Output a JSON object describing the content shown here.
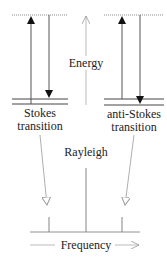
{
  "diagram": {
    "energy_label": "Energy",
    "stokes": {
      "line1": "Stokes",
      "line2": "transition"
    },
    "anti_stokes": {
      "line1": "anti-Stokes",
      "line2": "transition"
    },
    "rayleigh_label": "Rayleigh",
    "frequency_label": "Frequency"
  },
  "colors": {
    "ink": "#222222",
    "gray": "#9a9a9a",
    "dotted": "#8a8a8a"
  }
}
